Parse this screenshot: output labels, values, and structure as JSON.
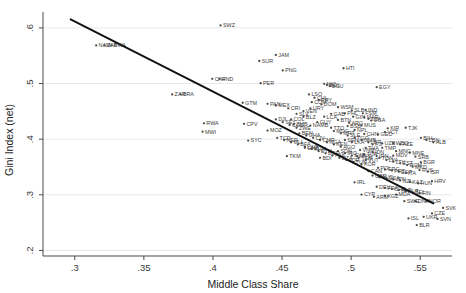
{
  "chart_data": {
    "type": "scatter",
    "title": "",
    "xlabel": "Middle Class Share",
    "ylabel": "Gini Index (net)",
    "xlim": [
      0.277,
      0.573
    ],
    "ylim": [
      0.19,
      0.625
    ],
    "xticks": [
      0.3,
      0.35,
      0.4,
      0.45,
      0.5,
      0.55
    ],
    "xticklabels": [
      ".3",
      ".35",
      ".4",
      ".45",
      ".5",
      ".55"
    ],
    "yticks": [
      0.2,
      0.3,
      0.4,
      0.5,
      0.6
    ],
    "yticklabels": [
      ".2",
      ".3",
      ".4",
      ".5",
      ".6"
    ],
    "grid": "horizontal",
    "legend": "none",
    "marker_color": "#4d4d4d",
    "fit_line_color": "#111111",
    "grid_color": "#e8e8ec",
    "fit_line": {
      "type": "linear",
      "x_start": 0.297,
      "y_start": 0.6155,
      "x_end": 0.5595,
      "y_end": 0.2845,
      "slope": -1.261,
      "intercept": 0.99
    },
    "series": [
      {
        "name": "countries",
        "point_label_field": "code",
        "points": [
          {
            "code": "SWZ",
            "x": 0.4055,
            "y": 0.6045
          },
          {
            "code": "NAM",
            "x": 0.3155,
            "y": 0.5685
          },
          {
            "code": "ZAF",
            "x": 0.3215,
            "y": 0.5685
          },
          {
            "code": "BWA",
            "x": 0.3265,
            "y": 0.5685
          },
          {
            "code": "SUR",
            "x": 0.4335,
            "y": 0.5405
          },
          {
            "code": "JAM",
            "x": 0.4455,
            "y": 0.5515
          },
          {
            "code": "PNG",
            "x": 0.4505,
            "y": 0.5235
          },
          {
            "code": "HTI",
            "x": 0.4945,
            "y": 0.5275
          },
          {
            "code": "CAF",
            "x": 0.3995,
            "y": 0.5085
          },
          {
            "code": "HND",
            "x": 0.4045,
            "y": 0.5085
          },
          {
            "code": "PER",
            "x": 0.4345,
            "y": 0.5005
          },
          {
            "code": "NIC",
            "x": 0.4805,
            "y": 0.4995
          },
          {
            "code": "BOL",
            "x": 0.4825,
            "y": 0.4975
          },
          {
            "code": "ECU",
            "x": 0.4845,
            "y": 0.4955
          },
          {
            "code": "EGY",
            "x": 0.5185,
            "y": 0.4935
          },
          {
            "code": "ZAR",
            "x": 0.3705,
            "y": 0.4805
          },
          {
            "code": "BRA",
            "x": 0.3765,
            "y": 0.4805
          },
          {
            "code": "LSO",
            "x": 0.4695,
            "y": 0.4805
          },
          {
            "code": "CHL",
            "x": 0.4735,
            "y": 0.4745
          },
          {
            "code": "PRY",
            "x": 0.4765,
            "y": 0.4705
          },
          {
            "code": "COM",
            "x": 0.4715,
            "y": 0.4665
          },
          {
            "code": "DOM",
            "x": 0.4785,
            "y": 0.4625
          },
          {
            "code": "GTM",
            "x": 0.4215,
            "y": 0.4655
          },
          {
            "code": "PAN",
            "x": 0.4395,
            "y": 0.4635
          },
          {
            "code": "MEX",
            "x": 0.4455,
            "y": 0.4605
          },
          {
            "code": "CRI",
            "x": 0.4545,
            "y": 0.4555
          },
          {
            "code": "WSM",
            "x": 0.4905,
            "y": 0.4575
          },
          {
            "code": "SLB",
            "x": 0.5005,
            "y": 0.4515
          },
          {
            "code": "IND",
            "x": 0.5105,
            "y": 0.4525
          },
          {
            "code": "PHL",
            "x": 0.4955,
            "y": 0.4465
          },
          {
            "code": "FSM",
            "x": 0.5085,
            "y": 0.4465
          },
          {
            "code": "GIN",
            "x": 0.5015,
            "y": 0.4405
          },
          {
            "code": "MAR",
            "x": 0.5095,
            "y": 0.4395
          },
          {
            "code": "TZA",
            "x": 0.5125,
            "y": 0.4365
          },
          {
            "code": "UGA",
            "x": 0.5145,
            "y": 0.4335
          },
          {
            "code": "RWA",
            "x": 0.3935,
            "y": 0.4285
          },
          {
            "code": "CPV",
            "x": 0.4225,
            "y": 0.4275
          },
          {
            "code": "MWI",
            "x": 0.3925,
            "y": 0.4135
          },
          {
            "code": "COL",
            "x": 0.4565,
            "y": 0.4355
          },
          {
            "code": "ZMB",
            "x": 0.4585,
            "y": 0.4265
          },
          {
            "code": "MOZ",
            "x": 0.4395,
            "y": 0.4155
          },
          {
            "code": "SYC",
            "x": 0.4255,
            "y": 0.3975
          },
          {
            "code": "ARG",
            "x": 0.4985,
            "y": 0.4295
          },
          {
            "code": "BSB",
            "x": 0.4975,
            "y": 0.4235
          },
          {
            "code": "NPL",
            "x": 0.5025,
            "y": 0.4165
          },
          {
            "code": "KIR",
            "x": 0.5265,
            "y": 0.4195
          },
          {
            "code": "TJK",
            "x": 0.5395,
            "y": 0.4205
          },
          {
            "code": "CHN",
            "x": 0.5095,
            "y": 0.4095
          },
          {
            "code": "GEO",
            "x": 0.5195,
            "y": 0.4085
          },
          {
            "code": "VCT",
            "x": 0.5245,
            "y": 0.4125
          },
          {
            "code": "BIH",
            "x": 0.5505,
            "y": 0.4025
          },
          {
            "code": "LBN",
            "x": 0.5545,
            "y": 0.3985
          },
          {
            "code": "ALB",
            "x": 0.5595,
            "y": 0.3945
          },
          {
            "code": "GNB",
            "x": 0.4665,
            "y": 0.3845
          },
          {
            "code": "TKM",
            "x": 0.4535,
            "y": 0.3695
          },
          {
            "code": "BDI",
            "x": 0.4775,
            "y": 0.3665
          },
          {
            "code": "SEN",
            "x": 0.4955,
            "y": 0.3985
          },
          {
            "code": "LKA",
            "x": 0.5005,
            "y": 0.3945
          },
          {
            "code": "WBG",
            "x": 0.5305,
            "y": 0.3925
          },
          {
            "code": "TMP",
            "x": 0.5225,
            "y": 0.3845
          },
          {
            "code": "MNG",
            "x": 0.5325,
            "y": 0.3785
          },
          {
            "code": "THA",
            "x": 0.5105,
            "y": 0.3845
          },
          {
            "code": "VNM",
            "x": 0.5065,
            "y": 0.3805
          },
          {
            "code": "IDN",
            "x": 0.5155,
            "y": 0.3765
          },
          {
            "code": "TUR",
            "x": 0.5095,
            "y": 0.3725
          },
          {
            "code": "MYS",
            "x": 0.5045,
            "y": 0.3695
          },
          {
            "code": "IRN",
            "x": 0.5185,
            "y": 0.3695
          },
          {
            "code": "SRB",
            "x": 0.5465,
            "y": 0.3685
          },
          {
            "code": "LVA",
            "x": 0.5255,
            "y": 0.3625
          },
          {
            "code": "LTU",
            "x": 0.5305,
            "y": 0.3595
          },
          {
            "code": "EST",
            "x": 0.5355,
            "y": 0.3565
          },
          {
            "code": "BGR",
            "x": 0.5505,
            "y": 0.3585
          },
          {
            "code": "ROM",
            "x": 0.5405,
            "y": 0.3535
          },
          {
            "code": "MKD",
            "x": 0.5445,
            "y": 0.3505
          },
          {
            "code": "POL",
            "x": 0.5195,
            "y": 0.3485
          },
          {
            "code": "GRC",
            "x": 0.5245,
            "y": 0.3455
          },
          {
            "code": "PRT",
            "x": 0.5295,
            "y": 0.3435
          },
          {
            "code": "ESP",
            "x": 0.5345,
            "y": 0.3415
          },
          {
            "code": "ITA",
            "x": 0.5395,
            "y": 0.3395
          },
          {
            "code": "RUS",
            "x": 0.5495,
            "y": 0.3445
          },
          {
            "code": "ISR",
            "x": 0.5555,
            "y": 0.3415
          },
          {
            "code": "GBR",
            "x": 0.5155,
            "y": 0.3345
          },
          {
            "code": "AUS",
            "x": 0.5205,
            "y": 0.3315
          },
          {
            "code": "USA",
            "x": 0.5255,
            "y": 0.3295
          },
          {
            "code": "JPN",
            "x": 0.5305,
            "y": 0.3275
          },
          {
            "code": "NZL",
            "x": 0.5355,
            "y": 0.3255
          },
          {
            "code": "KAZ",
            "x": 0.5425,
            "y": 0.3235
          },
          {
            "code": "HUN",
            "x": 0.5485,
            "y": 0.3205
          },
          {
            "code": "DEU",
            "x": 0.5185,
            "y": 0.3145
          },
          {
            "code": "FRA",
            "x": 0.5245,
            "y": 0.3125
          },
          {
            "code": "CHE",
            "x": 0.5295,
            "y": 0.3105
          },
          {
            "code": "NLD",
            "x": 0.5345,
            "y": 0.3085
          },
          {
            "code": "AUT",
            "x": 0.5395,
            "y": 0.3065
          },
          {
            "code": "BEL",
            "x": 0.5445,
            "y": 0.3045
          },
          {
            "code": "FIN",
            "x": 0.5495,
            "y": 0.3025
          },
          {
            "code": "SVK",
            "x": 0.5665,
            "y": 0.2765
          },
          {
            "code": "SVN",
            "x": 0.5625,
            "y": 0.2565
          },
          {
            "code": "CZE",
            "x": 0.5585,
            "y": 0.2665
          },
          {
            "code": "UKR",
            "x": 0.5525,
            "y": 0.2605
          },
          {
            "code": "ISL",
            "x": 0.5415,
            "y": 0.2575
          },
          {
            "code": "BLR",
            "x": 0.5475,
            "y": 0.2455
          },
          {
            "code": "DNK",
            "x": 0.5465,
            "y": 0.2885
          },
          {
            "code": "NOR",
            "x": 0.5545,
            "y": 0.2885
          },
          {
            "code": "SWE",
            "x": 0.5385,
            "y": 0.2885
          },
          {
            "code": "MDA",
            "x": 0.5325,
            "y": 0.3005
          },
          {
            "code": "KGZ",
            "x": 0.5245,
            "y": 0.2985
          },
          {
            "code": "ARM",
            "x": 0.5165,
            "y": 0.2965
          },
          {
            "code": "HRV",
            "x": 0.5585,
            "y": 0.3245
          },
          {
            "code": "CYP",
            "x": 0.5075,
            "y": 0.3005
          },
          {
            "code": "IRL",
            "x": 0.5025,
            "y": 0.3225
          },
          {
            "code": "CAN",
            "x": 0.5125,
            "y": 0.3425
          },
          {
            "code": "KOR",
            "x": 0.5075,
            "y": 0.3545
          },
          {
            "code": "TUN",
            "x": 0.5015,
            "y": 0.3585
          },
          {
            "code": "JOR",
            "x": 0.4965,
            "y": 0.3625
          },
          {
            "code": "DZA",
            "x": 0.4915,
            "y": 0.3665
          },
          {
            "code": "PAK",
            "x": 0.4865,
            "y": 0.3705
          },
          {
            "code": "BGD",
            "x": 0.4815,
            "y": 0.3745
          },
          {
            "code": "ETH",
            "x": 0.4765,
            "y": 0.3785
          },
          {
            "code": "KHM",
            "x": 0.4715,
            "y": 0.3825
          },
          {
            "code": "LAO",
            "x": 0.4665,
            "y": 0.3865
          },
          {
            "code": "BFA",
            "x": 0.4615,
            "y": 0.3905
          },
          {
            "code": "MLI",
            "x": 0.4565,
            "y": 0.3945
          },
          {
            "code": "NER",
            "x": 0.4515,
            "y": 0.3985
          },
          {
            "code": "TCD",
            "x": 0.4465,
            "y": 0.4025
          },
          {
            "code": "BEN",
            "x": 0.4625,
            "y": 0.4105
          },
          {
            "code": "GHA",
            "x": 0.4675,
            "y": 0.4065
          },
          {
            "code": "CIV",
            "x": 0.4725,
            "y": 0.4025
          },
          {
            "code": "CMR",
            "x": 0.4775,
            "y": 0.3985
          },
          {
            "code": "NGA",
            "x": 0.4825,
            "y": 0.3945
          },
          {
            "code": "KEN",
            "x": 0.4875,
            "y": 0.3905
          },
          {
            "code": "AGO",
            "x": 0.4925,
            "y": 0.3865
          },
          {
            "code": "MDG",
            "x": 0.4875,
            "y": 0.4145
          },
          {
            "code": "MRT",
            "x": 0.4925,
            "y": 0.4105
          },
          {
            "code": "SLE",
            "x": 0.4975,
            "y": 0.4065
          },
          {
            "code": "TGO",
            "x": 0.5025,
            "y": 0.4025
          },
          {
            "code": "GMB",
            "x": 0.5075,
            "y": 0.3985
          },
          {
            "code": "LBR",
            "x": 0.5125,
            "y": 0.3945
          },
          {
            "code": "UZB",
            "x": 0.5225,
            "y": 0.3925
          },
          {
            "code": "AZE",
            "x": 0.5355,
            "y": 0.3905
          },
          {
            "code": "MDV",
            "x": 0.5305,
            "y": 0.3705
          },
          {
            "code": "FJI",
            "x": 0.5155,
            "y": 0.3905
          },
          {
            "code": "TON",
            "x": 0.5205,
            "y": 0.3665
          },
          {
            "code": "VUT",
            "x": 0.5105,
            "y": 0.3625
          },
          {
            "code": "YEM",
            "x": 0.5055,
            "y": 0.3665
          },
          {
            "code": "SYR",
            "x": 0.5005,
            "y": 0.3705
          },
          {
            "code": "IRQ",
            "x": 0.4955,
            "y": 0.3745
          },
          {
            "code": "SDN",
            "x": 0.4905,
            "y": 0.3785
          },
          {
            "code": "MNE",
            "x": 0.5425,
            "y": 0.3755
          },
          {
            "code": "TTO",
            "x": 0.4855,
            "y": 0.4205
          },
          {
            "code": "GUY",
            "x": 0.4755,
            "y": 0.4305
          },
          {
            "code": "BLZ",
            "x": 0.4655,
            "y": 0.4405
          },
          {
            "code": "SLV",
            "x": 0.4605,
            "y": 0.4455
          },
          {
            "code": "VEN",
            "x": 0.4655,
            "y": 0.4505
          },
          {
            "code": "URY",
            "x": 0.4705,
            "y": 0.4555
          },
          {
            "code": "LCA",
            "x": 0.4805,
            "y": 0.4405
          },
          {
            "code": "MUS",
            "x": 0.5075,
            "y": 0.4245
          },
          {
            "code": "GAB",
            "x": 0.4855,
            "y": 0.4455
          },
          {
            "code": "BTN",
            "x": 0.4905,
            "y": 0.4345
          },
          {
            "code": "NAMB",
            "x": 0.4705,
            "y": 0.4245
          },
          {
            "code": "ZWE",
            "x": 0.4605,
            "y": 0.4205
          },
          {
            "code": "COG",
            "x": 0.4555,
            "y": 0.4255
          },
          {
            "code": "SEY",
            "x": 0.4505,
            "y": 0.4305
          },
          {
            "code": "DJI",
            "x": 0.4455,
            "y": 0.4355
          }
        ]
      }
    ]
  }
}
